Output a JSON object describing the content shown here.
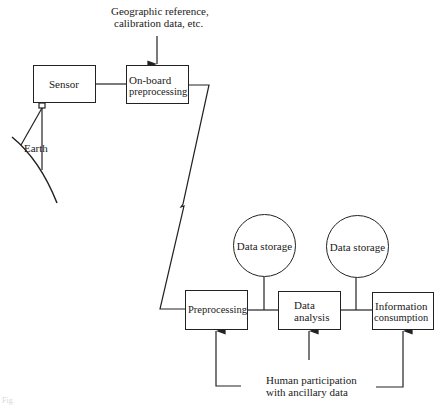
{
  "diagram": {
    "type": "remote-sensing-data-flow",
    "inputs": {
      "top_note_line1": "Geographic reference,",
      "top_note_line2": "calibration data, etc.",
      "bottom_note_line1": "Human participation",
      "bottom_note_line2": "with ancillary data"
    },
    "nodes": {
      "sensor": {
        "label": "Sensor"
      },
      "onboard": {
        "label_line1": "On-board",
        "label_line2": "preprocessing"
      },
      "earth": {
        "label": "Earth"
      },
      "preprocessing": {
        "label": "Preprocessing"
      },
      "analysis": {
        "label_line1": "Data",
        "label_line2": "analysis"
      },
      "consumption": {
        "label_line1": "Information",
        "label_line2": "consumption"
      },
      "storage1": {
        "label": "Data storage"
      },
      "storage2": {
        "label": "Data storage"
      }
    },
    "edges": [
      {
        "from": "sensor",
        "to": "onboard"
      },
      {
        "from": "onboard",
        "to": "preprocessing",
        "style": "telemetry-zigzag"
      },
      {
        "from": "preprocessing",
        "to": "analysis"
      },
      {
        "from": "analysis",
        "to": "consumption"
      },
      {
        "from": "storage1",
        "to": "preprocessing-analysis-link"
      },
      {
        "from": "storage2",
        "to": "analysis-consumption-link"
      },
      {
        "from": "top_note",
        "to": "onboard",
        "arrow": true
      },
      {
        "from": "bottom_note",
        "to": "preprocessing",
        "arrow": true
      },
      {
        "from": "bottom_note",
        "to": "analysis",
        "arrow": true
      },
      {
        "from": "bottom_note",
        "to": "consumption",
        "arrow": true
      }
    ],
    "colors": {
      "stroke": "#222222",
      "background": "#ffffff",
      "text": "#1a1a1a"
    }
  },
  "caption": {
    "text": "Fig."
  }
}
